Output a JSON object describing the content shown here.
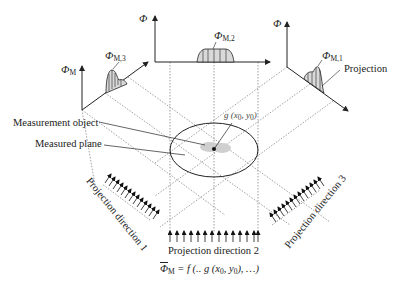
{
  "diagram": {
    "type": "tomography-projection-schematic",
    "axes": {
      "left": {
        "symbol": "Φ",
        "subscript": "M",
        "profile_label_symbol": "Φ",
        "profile_label_subscript": "M,3"
      },
      "top": {
        "symbol": "Φ",
        "profile_label_symbol": "Φ",
        "profile_label_subscript": "M,2"
      },
      "right": {
        "symbol": "Φ",
        "profile_label_symbol": "Φ",
        "profile_label_subscript": "M,1"
      }
    },
    "labels": {
      "projection": "Projection",
      "measurement_object": "Measurement object",
      "measured_plane": "Measured plane",
      "point": "g (x",
      "point_full": "g (x₀, y₀)",
      "projection_direction_1": "Projection direction 1",
      "projection_direction_2": "Projection direction 2",
      "projection_direction_3": "Projection direction 3",
      "formula": "Φ̄M = f (.. g (x₀, y₀), …)"
    },
    "formula": {
      "lhs_symbol": "Φ",
      "lhs_subscript": "M",
      "rhs": "= f (.. g (x",
      "x_sub": "0",
      "mid": ", y",
      "y_sub": "0",
      "tail": "), …)"
    },
    "point": {
      "prefix": "g (x",
      "x_sub": "0",
      "mid": ", y",
      "y_sub": "0",
      "tail": ")"
    },
    "colors": {
      "line": "#222222",
      "dotted": "#666666",
      "profile_fill": "#d9d9d9",
      "blob": "#cfcfcf"
    }
  }
}
